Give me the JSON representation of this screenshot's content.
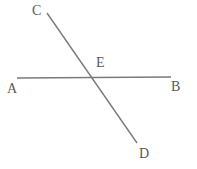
{
  "figure": {
    "type": "geometry-diagram",
    "background_color": "#ffffff",
    "stroke_color": "#7a7a7a",
    "label_color": "#595959",
    "width": 197,
    "height": 169
  },
  "labels": {
    "A": "A",
    "B": "B",
    "C": "C",
    "D": "D",
    "E": "E"
  },
  "points": {
    "A": {
      "name": "A",
      "x": 17,
      "y": 78
    },
    "B": {
      "name": "B",
      "x": 171,
      "y": 77
    },
    "C": {
      "name": "C",
      "x": 47,
      "y": 13
    },
    "D": {
      "name": "D",
      "x": 137,
      "y": 143
    },
    "E": {
      "name": "E",
      "x": 91,
      "y": 77
    }
  },
  "segments": [
    {
      "name": "line-AB",
      "from": "A",
      "to": "B",
      "x1": 17,
      "y1": 78,
      "x2": 171,
      "y2": 77,
      "stroke": "#7a7a7a",
      "width": 1.6
    },
    {
      "name": "line-CD",
      "from": "C",
      "to": "D",
      "x1": 47,
      "y1": 13,
      "x2": 137,
      "y2": 143,
      "stroke": "#7a7a7a",
      "width": 1.4
    }
  ]
}
